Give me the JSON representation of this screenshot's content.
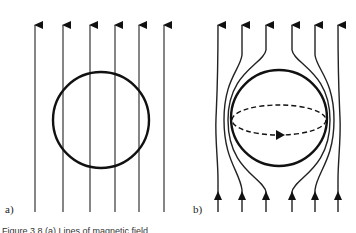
{
  "panels": [
    {
      "label": "a)",
      "description": "Uniform parallel field lines passing through a circle"
    },
    {
      "label": "b)",
      "description": "Field lines expelled around a sphere with circulating dashed current loop"
    }
  ],
  "caption": "Figure 3.8  (a) Lines of magnetic field ..."
}
